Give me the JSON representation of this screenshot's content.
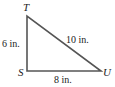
{
  "figure": {
    "type": "right-triangle",
    "vertices": {
      "T": {
        "label": "T"
      },
      "S": {
        "label": "S"
      },
      "U": {
        "label": "U"
      }
    },
    "sides": {
      "TS": {
        "label": "6 in."
      },
      "TU": {
        "label": "10 in."
      },
      "SU": {
        "label": "8 in."
      }
    },
    "right_angle_at": "S",
    "line_color": "#555555"
  }
}
